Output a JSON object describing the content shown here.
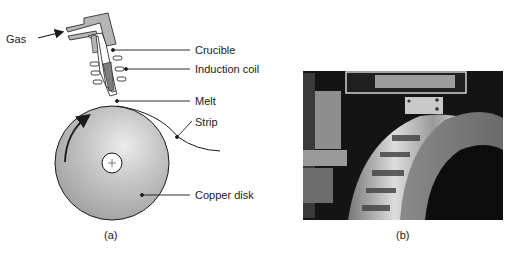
{
  "figure": {
    "panel_a": {
      "caption": "(a)",
      "labels": {
        "gas": "Gas",
        "crucible": "Crucible",
        "induction_coil": "Induction coil",
        "melt": "Melt",
        "strip": "Strip",
        "copper_disk": "Copper disk"
      },
      "disk_center_symbol": "+"
    },
    "panel_b": {
      "caption": "(b)",
      "photo_description": "Photograph of melt-spinning apparatus with metal strip on rotating wheel"
    }
  },
  "colors": {
    "line": "#1a1a1a",
    "disk_fill_light": "#e8e8e8",
    "disk_fill_dark": "#9a9a9a",
    "crucible_gray": "#b5b5b5",
    "melt_gray": "#7d7d7d"
  }
}
